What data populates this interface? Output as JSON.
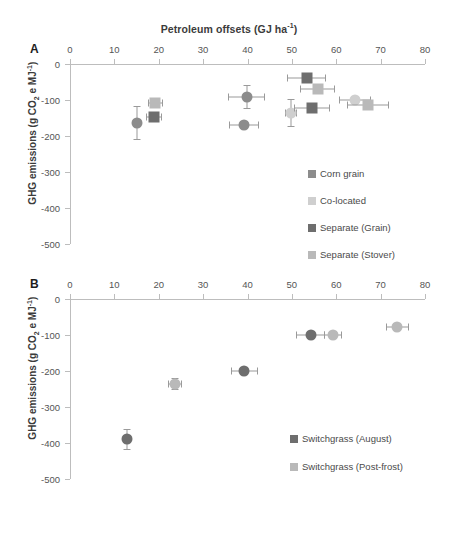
{
  "figure": {
    "title": "Petroleum offsets (GJ ha-1)",
    "title_main": "Petroleum offsets (GJ ha",
    "title_sup": "-1",
    "title_tail": ")",
    "panel_a_letter": "A",
    "panel_b_letter": "B",
    "ylabel_head": "GHG emissions (g CO",
    "ylabel_sub": "2",
    "ylabel_mid": " e MJ",
    "ylabel_sup": "-1",
    "ylabel_tail": ")"
  },
  "colors": {
    "dark_gray": "#6e6e6e",
    "mid_gray": "#8c8c8c",
    "light_gray": "#b9b9b9",
    "pale_gray": "#cfcfcf",
    "axis": "#bdbdbd",
    "text": "#4a4a4a"
  },
  "chart_data": [
    {
      "type": "scatter",
      "panel": "A",
      "title": "Petroleum offsets (GJ ha-1)",
      "xlabel": "Petroleum offsets (GJ ha-1)",
      "ylabel": "GHG emissions (g CO2 e MJ-1)",
      "xlim": [
        0,
        80
      ],
      "ylim": [
        -500,
        0
      ],
      "xticks": [
        0,
        10,
        20,
        30,
        40,
        50,
        60,
        70,
        80
      ],
      "yticks": [
        0,
        -100,
        -200,
        -300,
        -400,
        -500
      ],
      "grid": false,
      "xaxis_position": "top",
      "legend_position": "lower-right",
      "legend": [
        {
          "label": "Corn grain",
          "color": "#8c8c8c",
          "marker": "circle"
        },
        {
          "label": "Co-located",
          "color": "#cfcfcf",
          "marker": "circle"
        },
        {
          "label": "Separate (Grain)",
          "color": "#6e6e6e",
          "marker": "square"
        },
        {
          "label": "Separate (Stover)",
          "color": "#b9b9b9",
          "marker": "square"
        }
      ],
      "series": [
        {
          "name": "Corn grain",
          "color": "#8c8c8c",
          "marker": "circle",
          "points": [
            {
              "x": 15.2,
              "y": -163,
              "xerr": 0,
              "yerr": 47
            },
            {
              "x": 39.8,
              "y": -92,
              "xerr": 4.2,
              "yerr": 33
            },
            {
              "x": 39.3,
              "y": -170,
              "xerr": 3.4,
              "yerr": 0
            }
          ]
        },
        {
          "name": "Co-located",
          "color": "#cfcfcf",
          "marker": "circle",
          "points": [
            {
              "x": 49.8,
              "y": -136,
              "xerr": 1.4,
              "yerr": 38
            },
            {
              "x": 64.2,
              "y": -99,
              "xerr": 3.6,
              "yerr": 11
            }
          ]
        },
        {
          "name": "Separate (Grain)",
          "color": "#6e6e6e",
          "marker": "square",
          "points": [
            {
              "x": 19.0,
              "y": -148,
              "xerr": 1.8,
              "yerr": 0
            },
            {
              "x": 53.3,
              "y": -38,
              "xerr": 4.3,
              "yerr": 0
            },
            {
              "x": 54.5,
              "y": -122,
              "xerr": 4.1,
              "yerr": 0
            }
          ]
        },
        {
          "name": "Separate (Stover)",
          "color": "#b9b9b9",
          "marker": "square",
          "points": [
            {
              "x": 19.2,
              "y": -108,
              "xerr": 1.7,
              "yerr": 0
            },
            {
              "x": 55.8,
              "y": -69,
              "xerr": 3.9,
              "yerr": 0
            },
            {
              "x": 67.2,
              "y": -115,
              "xerr": 4.8,
              "yerr": 0
            }
          ]
        }
      ]
    },
    {
      "type": "scatter",
      "panel": "B",
      "xlabel": "Petroleum offsets (GJ ha-1)",
      "ylabel": "GHG emissions (g CO2 e MJ-1)",
      "xlim": [
        0,
        80
      ],
      "ylim": [
        -500,
        0
      ],
      "xticks": [
        0,
        10,
        20,
        30,
        40,
        50,
        60,
        70,
        80
      ],
      "yticks": [
        0,
        -100,
        -200,
        -300,
        -400,
        -500
      ],
      "grid": false,
      "xaxis_position": "top",
      "legend_position": "lower-right",
      "legend": [
        {
          "label": "Switchgrass (August)",
          "color": "#6e6e6e",
          "marker": "circle"
        },
        {
          "label": "Switchgrass (Post-frost)",
          "color": "#b9b9b9",
          "marker": "circle"
        }
      ],
      "series": [
        {
          "name": "Switchgrass (August)",
          "color": "#6e6e6e",
          "marker": "circle",
          "points": [
            {
              "x": 12.8,
              "y": -390,
              "xerr": 0,
              "yerr": 30
            },
            {
              "x": 39.3,
              "y": -200,
              "xerr": 3.0,
              "yerr": 8
            },
            {
              "x": 54.2,
              "y": -100,
              "xerr": 3.2,
              "yerr": 0
            }
          ]
        },
        {
          "name": "Switchgrass (Post-frost)",
          "color": "#b9b9b9",
          "marker": "circle",
          "points": [
            {
              "x": 23.6,
              "y": -236,
              "xerr": 1.6,
              "yerr": 16
            },
            {
              "x": 59.3,
              "y": -100,
              "xerr": 2.0,
              "yerr": 0
            },
            {
              "x": 73.8,
              "y": -78,
              "xerr": 2.6,
              "yerr": 0
            }
          ]
        }
      ]
    }
  ]
}
